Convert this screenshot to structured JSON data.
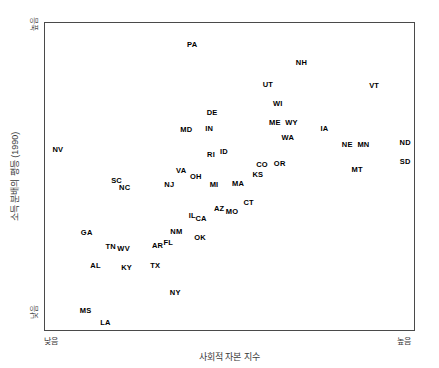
{
  "chart_data": {
    "type": "scatter",
    "title": "",
    "xlabel": "사회적 자본 지수",
    "ylabel": "소득 분배의 평등 (1990)",
    "xlim": [
      0,
      100
    ],
    "ylim": [
      0,
      100
    ],
    "grid": false,
    "legend": null,
    "axis_tick_labels": {
      "x_low": "낮음",
      "x_high": "높음",
      "y_low": "낮음",
      "y_high": "높음"
    },
    "point_color": "#000000",
    "frame_color": "#4a4a4a",
    "points": [
      {
        "label": "PA",
        "x": 39.9,
        "y": 92.9
      },
      {
        "label": "NH",
        "x": 69.5,
        "y": 87.1
      },
      {
        "label": "VT",
        "x": 89.2,
        "y": 79.6
      },
      {
        "label": "UT",
        "x": 60.4,
        "y": 79.9
      },
      {
        "label": "WI",
        "x": 63.1,
        "y": 73.5
      },
      {
        "label": "DE",
        "x": 45.3,
        "y": 70.6
      },
      {
        "label": "MD",
        "x": 38.3,
        "y": 65.0
      },
      {
        "label": "IN",
        "x": 44.5,
        "y": 65.4
      },
      {
        "label": "ME",
        "x": 62.3,
        "y": 67.3
      },
      {
        "label": "WY",
        "x": 66.8,
        "y": 67.3
      },
      {
        "label": "WA",
        "x": 65.8,
        "y": 62.5
      },
      {
        "label": "IA",
        "x": 75.7,
        "y": 65.4
      },
      {
        "label": "NE",
        "x": 81.9,
        "y": 60.2
      },
      {
        "label": "MN",
        "x": 86.3,
        "y": 60.2
      },
      {
        "label": "ND",
        "x": 97.6,
        "y": 60.8
      },
      {
        "label": "SD",
        "x": 97.6,
        "y": 54.7
      },
      {
        "label": "NV",
        "x": 3.5,
        "y": 58.6
      },
      {
        "label": "RI",
        "x": 45.0,
        "y": 57.0
      },
      {
        "label": "ID",
        "x": 48.5,
        "y": 57.9
      },
      {
        "label": "CO",
        "x": 58.8,
        "y": 53.7
      },
      {
        "label": "OR",
        "x": 63.6,
        "y": 54.0
      },
      {
        "label": "MT",
        "x": 84.6,
        "y": 52.1
      },
      {
        "label": "KS",
        "x": 57.7,
        "y": 50.5
      },
      {
        "label": "SC",
        "x": 19.4,
        "y": 48.5
      },
      {
        "label": "NC",
        "x": 21.6,
        "y": 46.3
      },
      {
        "label": "VA",
        "x": 36.9,
        "y": 51.8
      },
      {
        "label": "OH",
        "x": 40.9,
        "y": 49.8
      },
      {
        "label": "NJ",
        "x": 33.7,
        "y": 47.2
      },
      {
        "label": "MI",
        "x": 45.8,
        "y": 47.2
      },
      {
        "label": "MA",
        "x": 52.3,
        "y": 47.6
      },
      {
        "label": "CT",
        "x": 55.2,
        "y": 41.4
      },
      {
        "label": "AZ",
        "x": 47.2,
        "y": 39.5
      },
      {
        "label": "MO",
        "x": 50.7,
        "y": 38.5
      },
      {
        "label": "IL",
        "x": 39.9,
        "y": 37.2
      },
      {
        "label": "CA",
        "x": 42.3,
        "y": 36.2
      },
      {
        "label": "NM",
        "x": 35.6,
        "y": 32.0
      },
      {
        "label": "OK",
        "x": 42.0,
        "y": 30.1
      },
      {
        "label": "GA",
        "x": 11.3,
        "y": 31.7
      },
      {
        "label": "TN",
        "x": 17.8,
        "y": 26.9
      },
      {
        "label": "WV",
        "x": 21.3,
        "y": 26.5
      },
      {
        "label": "AR",
        "x": 30.5,
        "y": 27.2
      },
      {
        "label": "FL",
        "x": 33.4,
        "y": 28.2
      },
      {
        "label": "AL",
        "x": 13.7,
        "y": 21.0
      },
      {
        "label": "KY",
        "x": 22.1,
        "y": 20.1
      },
      {
        "label": "TX",
        "x": 29.9,
        "y": 20.7
      },
      {
        "label": "NY",
        "x": 35.3,
        "y": 12.0
      },
      {
        "label": "MS",
        "x": 11.0,
        "y": 6.1
      },
      {
        "label": "LA",
        "x": 16.4,
        "y": 2.3
      }
    ]
  }
}
